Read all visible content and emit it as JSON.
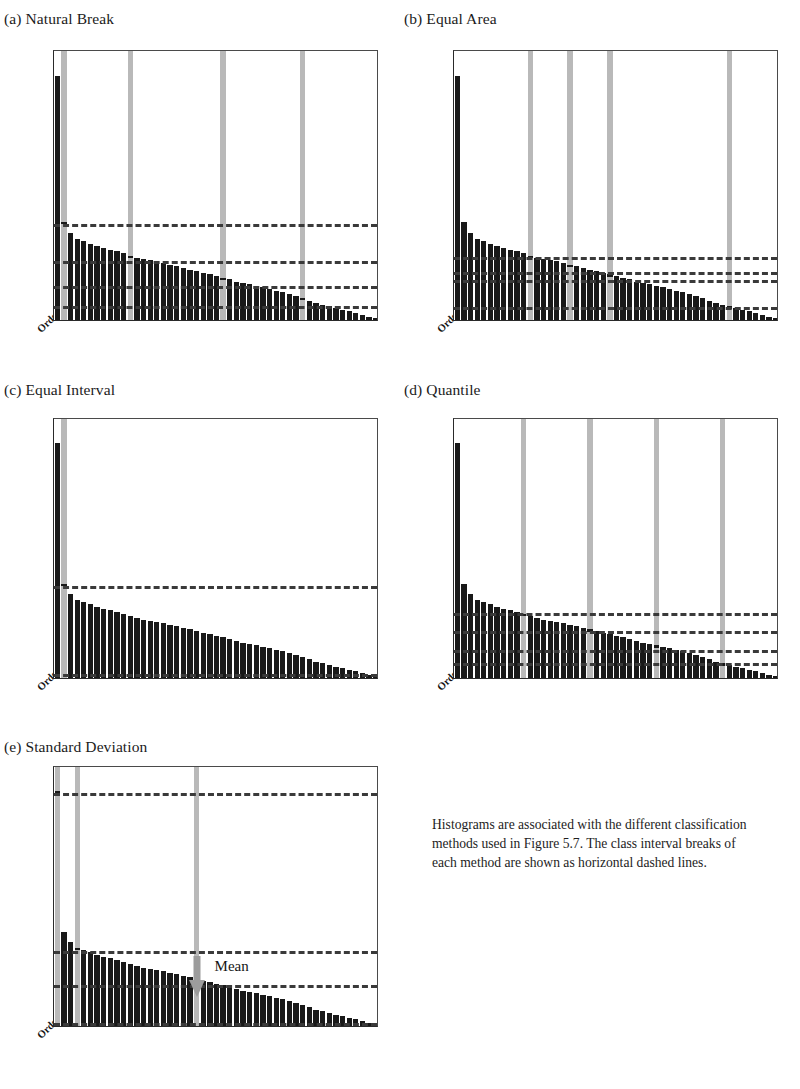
{
  "figure": {
    "caption": "Histograms are associated with the different classification methods used in Figure 5.7. The class interval breaks of each method are shown as horizontal dashed lines.",
    "mean_label": "Mean",
    "order_axis_label": "Order",
    "bar_color": "#191919",
    "highlight_color": "#b9b9b9",
    "dash_color": "#3a3a3a",
    "axis_color": "#2a2a2a"
  },
  "chart_data": [
    {
      "type": "bar",
      "title": "(a) Natural Break",
      "panel": "a",
      "xlabel": "Order",
      "ylabel": "",
      "ylim": [
        0,
        500
      ],
      "yticks": [
        "0.00",
        "50.00",
        "100.00",
        "150.00",
        "200.00",
        "250.00",
        "300.00",
        "350.00",
        "400.00",
        "450.00",
        "500.00"
      ],
      "ytick_values": [
        0,
        50,
        100,
        150,
        200,
        250,
        300,
        350,
        400,
        450,
        500
      ],
      "xticks": [
        "2",
        "4",
        "6",
        "8",
        "10",
        "12",
        "14",
        "16",
        "18",
        "20",
        "22",
        "24",
        "26",
        "28",
        "30",
        "32",
        "34",
        "36",
        "38",
        "40",
        "42",
        "44",
        "46",
        "48"
      ],
      "grid": false,
      "categories": [
        1,
        2,
        3,
        4,
        5,
        6,
        7,
        8,
        9,
        10,
        11,
        12,
        13,
        14,
        15,
        16,
        17,
        18,
        19,
        20,
        21,
        22,
        23,
        24,
        25,
        26,
        27,
        28,
        29,
        30,
        31,
        32,
        33,
        34,
        35,
        36,
        37,
        38,
        39,
        40,
        41,
        42,
        43,
        44,
        45,
        46,
        47,
        48,
        49
      ],
      "values": [
        450,
        181,
        160,
        150,
        146,
        141,
        137,
        133,
        130,
        127,
        123,
        119,
        115,
        112,
        110,
        108,
        105,
        102,
        99,
        96,
        93,
        90,
        87,
        84,
        81,
        78,
        75,
        70,
        68,
        66,
        63,
        60,
        57,
        54,
        51,
        48,
        45,
        41,
        36,
        31,
        28,
        25,
        22,
        19,
        16,
        13,
        10,
        6,
        3
      ],
      "highlighted_bars": [
        2,
        12,
        26,
        38
      ],
      "class_breaks": [
        181,
        113,
        67,
        30
      ],
      "annotations": []
    },
    {
      "type": "bar",
      "title": "(b) Equal Area",
      "panel": "b",
      "xlabel": "Order",
      "ylabel": "",
      "ylim": [
        0,
        500
      ],
      "yticks": [
        "0.00",
        "50.00",
        "100.00",
        "150.00",
        "200.00",
        "250.00",
        "300.00",
        "350.00",
        "400.00",
        "450.00",
        "500.00"
      ],
      "ytick_values": [
        0,
        50,
        100,
        150,
        200,
        250,
        300,
        350,
        400,
        450,
        500
      ],
      "xticks": [
        "2",
        "4",
        "6",
        "8",
        "10",
        "12",
        "14",
        "16",
        "18",
        "20",
        "22",
        "24",
        "26",
        "28",
        "30",
        "32",
        "34",
        "36",
        "38",
        "40",
        "42",
        "44",
        "46",
        "48"
      ],
      "grid": false,
      "categories": [
        1,
        2,
        3,
        4,
        5,
        6,
        7,
        8,
        9,
        10,
        11,
        12,
        13,
        14,
        15,
        16,
        17,
        18,
        19,
        20,
        21,
        22,
        23,
        24,
        25,
        26,
        27,
        28,
        29,
        30,
        31,
        32,
        33,
        34,
        35,
        36,
        37,
        38,
        39,
        40,
        41,
        42,
        43,
        44,
        45,
        46,
        47,
        48,
        49
      ],
      "values": [
        450,
        181,
        160,
        150,
        146,
        141,
        137,
        133,
        130,
        127,
        123,
        119,
        115,
        112,
        110,
        108,
        105,
        102,
        99,
        96,
        93,
        90,
        87,
        84,
        81,
        78,
        75,
        70,
        68,
        66,
        63,
        60,
        57,
        54,
        51,
        48,
        45,
        41,
        36,
        31,
        28,
        25,
        22,
        19,
        16,
        13,
        10,
        6,
        3
      ],
      "highlighted_bars": [
        12,
        18,
        24,
        42
      ],
      "class_breaks": [
        120,
        93,
        78,
        27
      ],
      "annotations": []
    },
    {
      "type": "bar",
      "title": "(c) Equal Interval",
      "panel": "c",
      "xlabel": "Order",
      "ylabel": "",
      "ylim": [
        0,
        500
      ],
      "yticks": [
        "0.00",
        "50.00",
        "100.00",
        "150.00",
        "200.00",
        "250.00",
        "300.00",
        "350.00",
        "400.00",
        "450.00",
        "500.00"
      ],
      "ytick_values": [
        0,
        50,
        100,
        150,
        200,
        250,
        300,
        350,
        400,
        450,
        500
      ],
      "xticks": [
        "2",
        "4",
        "6",
        "8",
        "10",
        "12",
        "14",
        "16",
        "18",
        "20",
        "22",
        "24",
        "26",
        "28",
        "30",
        "32",
        "34",
        "36",
        "38",
        "40",
        "42",
        "44",
        "46",
        "48"
      ],
      "grid": false,
      "categories": [
        1,
        2,
        3,
        4,
        5,
        6,
        7,
        8,
        9,
        10,
        11,
        12,
        13,
        14,
        15,
        16,
        17,
        18,
        19,
        20,
        21,
        22,
        23,
        24,
        25,
        26,
        27,
        28,
        29,
        30,
        31,
        32,
        33,
        34,
        35,
        36,
        37,
        38,
        39,
        40,
        41,
        42,
        43,
        44,
        45,
        46,
        47,
        48,
        49
      ],
      "values": [
        450,
        181,
        160,
        150,
        146,
        141,
        137,
        133,
        130,
        127,
        123,
        119,
        115,
        112,
        110,
        108,
        105,
        102,
        99,
        96,
        93,
        90,
        87,
        84,
        81,
        78,
        75,
        70,
        68,
        66,
        63,
        60,
        57,
        54,
        51,
        48,
        45,
        41,
        36,
        31,
        28,
        25,
        22,
        19,
        16,
        13,
        10,
        6,
        3
      ],
      "highlighted_bars": [
        2
      ],
      "class_breaks": [
        180,
        12
      ],
      "annotations": []
    },
    {
      "type": "bar",
      "title": "(d) Quantile",
      "panel": "d",
      "xlabel": "Order",
      "ylabel": "",
      "ylim": [
        0,
        500
      ],
      "yticks": [
        "0.00",
        "50.00",
        "100.00",
        "150.00",
        "200.00",
        "250.00",
        "300.00",
        "350.00",
        "400.00",
        "450.00",
        "500.00"
      ],
      "ytick_values": [
        0,
        50,
        100,
        150,
        200,
        250,
        300,
        350,
        400,
        450,
        500
      ],
      "xticks": [
        "2",
        "4",
        "6",
        "8",
        "10",
        "12",
        "14",
        "16",
        "18",
        "20",
        "22",
        "24",
        "26",
        "28",
        "30",
        "32",
        "34",
        "36",
        "38",
        "40",
        "42",
        "44",
        "46",
        "48"
      ],
      "grid": false,
      "categories": [
        1,
        2,
        3,
        4,
        5,
        6,
        7,
        8,
        9,
        10,
        11,
        12,
        13,
        14,
        15,
        16,
        17,
        18,
        19,
        20,
        21,
        22,
        23,
        24,
        25,
        26,
        27,
        28,
        29,
        30,
        31,
        32,
        33,
        34,
        35,
        36,
        37,
        38,
        39,
        40,
        41,
        42,
        43,
        44,
        45,
        46,
        47,
        48,
        49
      ],
      "values": [
        450,
        181,
        160,
        150,
        146,
        141,
        137,
        133,
        130,
        127,
        123,
        119,
        115,
        112,
        110,
        108,
        105,
        102,
        99,
        96,
        93,
        90,
        87,
        84,
        81,
        78,
        75,
        70,
        68,
        66,
        63,
        60,
        57,
        54,
        51,
        48,
        45,
        41,
        36,
        31,
        28,
        25,
        22,
        19,
        16,
        13,
        10,
        6,
        3
      ],
      "highlighted_bars": [
        11,
        21,
        31,
        41
      ],
      "class_breaks": [
        128,
        93,
        58,
        32
      ],
      "annotations": []
    },
    {
      "type": "bar",
      "title": "(e) Standard Deviation",
      "panel": "e",
      "xlabel": "Order",
      "ylabel": "",
      "ylim": [
        0,
        500
      ],
      "yticks": [
        "0.00",
        "50.00",
        "100.00",
        "150.00",
        "200.00",
        "250.00",
        "300.00",
        "350.00",
        "400.00",
        "450.00",
        "500.00"
      ],
      "ytick_values": [
        0,
        50,
        100,
        150,
        200,
        250,
        300,
        350,
        400,
        450,
        500
      ],
      "xticks": [
        "2",
        "4",
        "6",
        "8",
        "10",
        "12",
        "14",
        "16",
        "18",
        "20",
        "22",
        "24",
        "26",
        "28",
        "30",
        "32",
        "34",
        "36",
        "38",
        "40",
        "42",
        "44",
        "46",
        "48"
      ],
      "grid": false,
      "categories": [
        1,
        2,
        3,
        4,
        5,
        6,
        7,
        8,
        9,
        10,
        11,
        12,
        13,
        14,
        15,
        16,
        17,
        18,
        19,
        20,
        21,
        22,
        23,
        24,
        25,
        26,
        27,
        28,
        29,
        30,
        31,
        32,
        33,
        34,
        35,
        36,
        37,
        38,
        39,
        40,
        41,
        42,
        43,
        44,
        45,
        46,
        47,
        48,
        49
      ],
      "values": [
        450,
        181,
        160,
        150,
        146,
        141,
        137,
        133,
        130,
        127,
        123,
        119,
        115,
        112,
        110,
        108,
        105,
        102,
        99,
        96,
        93,
        90,
        87,
        84,
        81,
        78,
        75,
        70,
        68,
        66,
        63,
        60,
        57,
        54,
        51,
        48,
        45,
        41,
        36,
        31,
        28,
        25,
        22,
        19,
        16,
        13,
        10,
        6,
        3
      ],
      "highlighted_bars": [
        1,
        4,
        22
      ],
      "class_breaks": [
        450,
        148,
        83,
        10
      ],
      "annotations": [
        {
          "label": "Mean",
          "at_category": 22,
          "value": 115
        }
      ]
    }
  ]
}
